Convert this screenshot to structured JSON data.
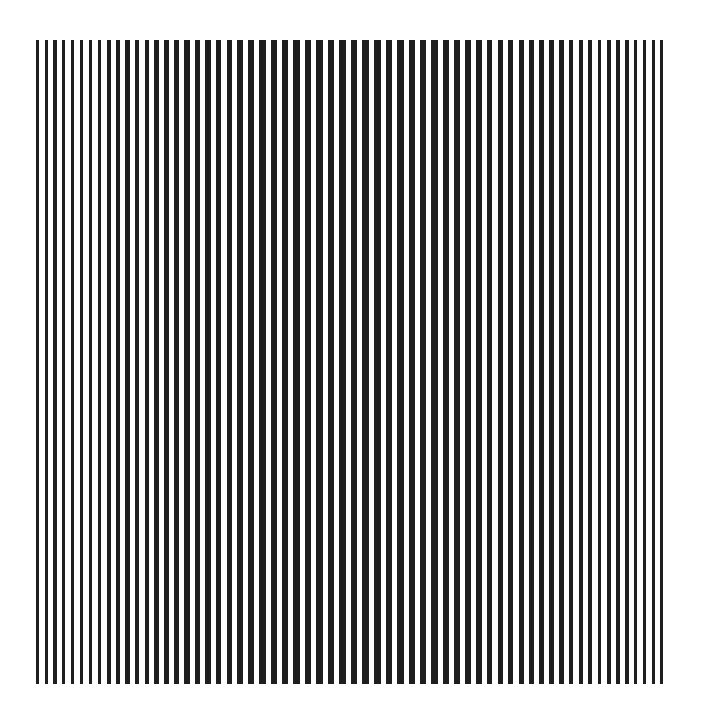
{
  "artwork": {
    "type": "op-art vertical stripe pattern",
    "background_color": "#ffffff",
    "stripe_color": "#1e1e1e",
    "field": {
      "left": 36,
      "right": 668,
      "top": 40,
      "bottom": 684
    },
    "stripe_geometry": {
      "edge_period": 8.6,
      "center_period": 11.6,
      "edge_width": 3.2,
      "center_width": 6.6,
      "center_x": 352
    },
    "approx_stripe_count": 62
  }
}
